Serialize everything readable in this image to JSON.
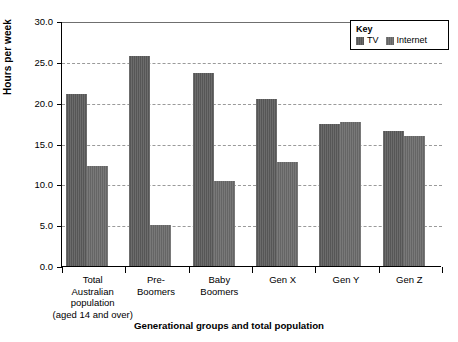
{
  "chart_data": {
    "type": "bar",
    "title": "",
    "subtitle": "",
    "xlabel": "Generational groups and total population",
    "ylabel": "Hours per week",
    "ylim": [
      0.0,
      30.0
    ],
    "ytick_step": 5.0,
    "ytick_labels": [
      "30.0",
      "25.0",
      "20.0",
      "15.0",
      "10.0",
      "5.0",
      "0.0"
    ],
    "ytick_values": [
      30.0,
      25.0,
      20.0,
      15.0,
      10.0,
      5.0,
      0.0
    ],
    "grid": "horizontal-dashed",
    "legend_position": "top-right",
    "legend_title": "Key",
    "categories": [
      "Total Australian population (aged 14 and over)",
      "Pre-Boomers",
      "Baby Boomers",
      "Gen X",
      "Gen Y",
      "Gen Z"
    ],
    "category_label_lines": [
      [
        "Total",
        "Australian",
        "population",
        "(aged 14 and over)"
      ],
      [
        "Pre-",
        "Boomers"
      ],
      [
        "Baby",
        "Boomers"
      ],
      [
        "Gen X"
      ],
      [
        "Gen Y"
      ],
      [
        "Gen Z"
      ]
    ],
    "series": [
      {
        "name": "TV",
        "color": "#565656",
        "values": [
          21.1,
          25.7,
          23.6,
          20.4,
          17.4,
          16.5
        ]
      },
      {
        "name": "Internet",
        "color": "#656565",
        "values": [
          12.3,
          5.0,
          10.4,
          12.7,
          17.6,
          15.9
        ]
      }
    ]
  },
  "legend": {
    "title": "Key",
    "items": [
      {
        "label": "TV",
        "color": "#565656"
      },
      {
        "label": "Internet",
        "color": "#656565"
      }
    ]
  },
  "axes": {
    "y_title": "Hours per week",
    "x_title": "Generational groups and total population"
  }
}
